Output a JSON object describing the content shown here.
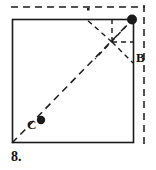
{
  "figure": {
    "number_label": "8.",
    "point_labels": {
      "b": "B",
      "c": "C"
    },
    "colors": {
      "ink": "#1a1a1a",
      "paper": "#ffffff"
    },
    "geometry": {
      "square": {
        "x": 12,
        "y": 19,
        "width": 122,
        "height": 124
      },
      "points": {
        "B": {
          "x": 133,
          "y": 19
        },
        "C": {
          "x": 41,
          "y": 120
        },
        "intersection": {
          "x": 112,
          "y": 42
        },
        "bottom_left": {
          "x": 12,
          "y": 143
        },
        "right_edge_mark": {
          "x": 133,
          "y": 62
        },
        "top_tick": {
          "x": 88,
          "y": 9
        }
      },
      "dashed_guides": {
        "top_horizontal": {
          "x1": 11,
          "y1": 7,
          "x2": 145,
          "y2": 7
        },
        "right_vertical": {
          "x1": 144,
          "y1": 5,
          "x2": 144,
          "y2": 146
        },
        "fold_vertical": {
          "x1": 112,
          "y1": 19,
          "x2": 112,
          "y2": 42
        },
        "fold_horizontal": {
          "x1": 112,
          "y1": 42,
          "x2": 133,
          "y2": 42
        },
        "main_diagonal": {
          "x1": 12,
          "y1": 143,
          "x2": 133,
          "y2": 19
        },
        "crease_from_B": {
          "x1": 133,
          "y1": 19,
          "x2": 96,
          "y2": 58
        },
        "crease_to_right": {
          "x1": 112,
          "y1": 42,
          "x2": 133,
          "y2": 62
        },
        "crease_upper_left": {
          "x1": 112,
          "y1": 42,
          "x2": 86,
          "y2": 19
        }
      }
    }
  }
}
